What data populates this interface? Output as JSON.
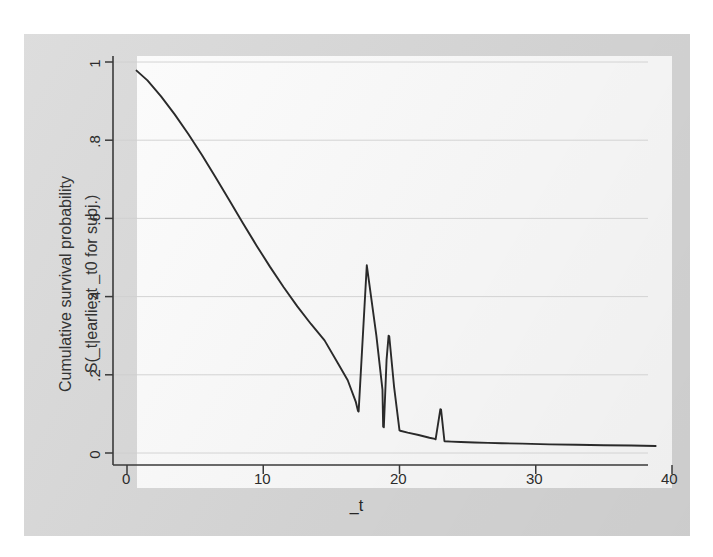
{
  "figure": {
    "background_color": "#d9d9d9",
    "plot_background_color": "#fdfdfd",
    "line_color": "#2a2a2a",
    "grid_color": "#cfcfcf",
    "axis_color": "#3a3a3a",
    "text_color": "#262626"
  },
  "axes": {
    "y_label_line1": "Cumulative survival probability",
    "y_label_line2": "S(_t|earliest _t0 for subj.)",
    "x_label": "_t",
    "x_ticks": [
      "0",
      "10",
      "20",
      "30",
      "40"
    ],
    "y_ticks": [
      "0",
      ".2",
      ".4",
      ".6",
      ".8",
      "1"
    ]
  },
  "chart_data": {
    "type": "line",
    "title": "",
    "subtitle": "",
    "xlabel": "_t",
    "ylabel": "Cumulative survival probability S(_t|earliest _t0 for subj.)",
    "xlim": [
      0,
      40
    ],
    "ylim": [
      0,
      1
    ],
    "xticks": [
      0,
      10,
      20,
      30,
      40
    ],
    "yticks": [
      0,
      0.2,
      0.4,
      0.6,
      0.8,
      1
    ],
    "grid": "horizontal",
    "legend": "none",
    "series": [
      {
        "name": "Cumulative survival probability",
        "x": [
          0.7,
          1.5,
          2.5,
          3.5,
          4.5,
          5.5,
          6.5,
          7.5,
          8.5,
          9.5,
          10.5,
          11.5,
          12.5,
          13.5,
          14.5,
          15.5,
          16.2,
          16.8,
          16.95,
          17.0,
          17.6,
          18.3,
          18.75,
          18.8,
          18.85,
          19.05,
          19.2,
          19.25,
          19.6,
          20.0,
          20.05,
          20.6,
          21.4,
          22.2,
          22.6,
          22.65,
          23.0,
          23.05,
          23.3,
          23.8,
          24.5,
          25.5,
          26.5,
          27.5,
          29.0,
          31.0,
          33.0,
          35.0,
          37.0,
          38.8
        ],
        "y": [
          0.978,
          0.953,
          0.912,
          0.866,
          0.816,
          0.762,
          0.705,
          0.647,
          0.588,
          0.531,
          0.476,
          0.424,
          0.375,
          0.33,
          0.288,
          0.228,
          0.186,
          0.13,
          0.108,
          0.106,
          0.48,
          0.301,
          0.162,
          0.067,
          0.066,
          0.238,
          0.3,
          0.298,
          0.17,
          0.058,
          0.057,
          0.052,
          0.046,
          0.039,
          0.036,
          0.035,
          0.112,
          0.111,
          0.03,
          0.029,
          0.028,
          0.027,
          0.026,
          0.025,
          0.024,
          0.022,
          0.021,
          0.02,
          0.019,
          0.018
        ]
      }
    ],
    "annotations": [
      {
        "label": "first spike peak",
        "x": 17.6,
        "y": 0.48
      },
      {
        "label": "second spike peak",
        "x": 19.2,
        "y": 0.3
      },
      {
        "label": "third spike peak",
        "x": 23.0,
        "y": 0.112
      }
    ]
  }
}
